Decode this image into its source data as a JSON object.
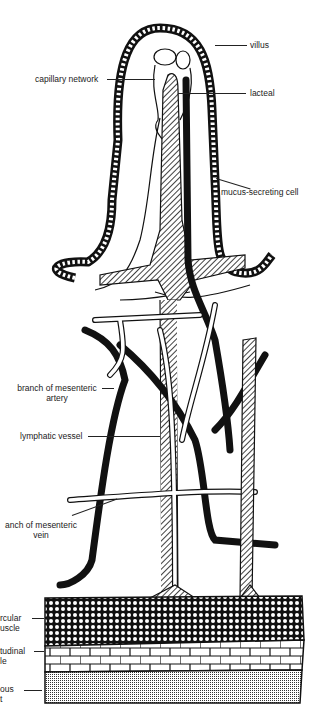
{
  "diagram": {
    "colors": {
      "ink": "#111111",
      "background": "#ffffff",
      "label": "#222222"
    },
    "labels": {
      "villus": "villus",
      "capillary_network": "capillary network",
      "lacteal": "lacteal",
      "mucus_cell": "mucus-secreting cell",
      "artery_line1": "branch of mesenteric",
      "artery_line2": "artery",
      "lymphatic": "lymphatic vessel",
      "vein_line1": "anch of mesenteric",
      "vein_line2": "vein",
      "circular_line1": "rcular",
      "circular_line2": "uscle",
      "longitudinal_line1": "tudinal",
      "longitudinal_line2": "le",
      "serous_line1": "ous",
      "serous_line2": "t"
    },
    "layers": [
      "circular muscle",
      "longitudinal muscle",
      "serous coat"
    ]
  }
}
